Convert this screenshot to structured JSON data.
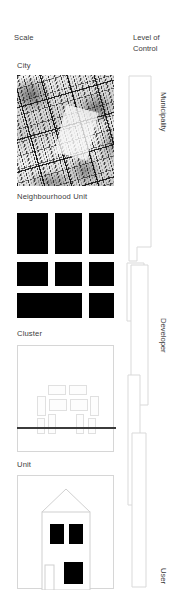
{
  "headers": {
    "scale": "Scale",
    "level_of_control_line1": "Level of",
    "level_of_control_line2": "Control"
  },
  "scale_rows": [
    {
      "label": "City",
      "figure": "city-map"
    },
    {
      "label": "Neighbourhood Unit",
      "figure": "figure-ground-blocks"
    },
    {
      "label": "Cluster",
      "figure": "cluster-site-plan"
    },
    {
      "label": "Unit",
      "figure": "house-elevation"
    }
  ],
  "control_levels": [
    {
      "label": "Municipality"
    },
    {
      "label": "Developer"
    },
    {
      "label": "User"
    }
  ],
  "colors": {
    "text": "#3c3c3c",
    "block_fill": "#000000",
    "outline": "#d6d6d6",
    "road_line": "#3b3b3b",
    "background": "#ffffff"
  },
  "figure_ground": {
    "description": "3 by 3 grid of solid black urban blocks separated by white street corridors",
    "rows": 3,
    "columns": 3
  },
  "cluster_plan": {
    "description": "Light outlined building footprints arranged around a courtyard with a dark street line below"
  },
  "unit_elevation": {
    "description": "Single house elevation with pitched roof, two dark upper windows, a door and one dark lower window"
  }
}
